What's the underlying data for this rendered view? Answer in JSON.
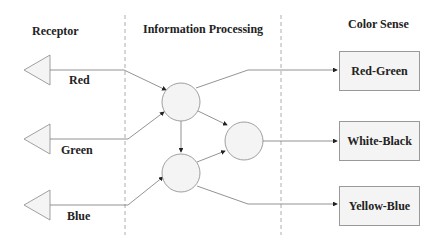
{
  "headers": {
    "receptor": "Receptor",
    "processing": "Information Processing",
    "color_sense": "Color Sense"
  },
  "receptors": [
    {
      "label": "Red"
    },
    {
      "label": "Green"
    },
    {
      "label": "Blue"
    }
  ],
  "outputs": [
    {
      "label": "Red-Green"
    },
    {
      "label": "White-Black"
    },
    {
      "label": "Yellow-Blue"
    }
  ],
  "colors": {
    "stroke": "#777777",
    "fill": "#f4f4f4",
    "divider": "#999999",
    "text": "#222222"
  }
}
